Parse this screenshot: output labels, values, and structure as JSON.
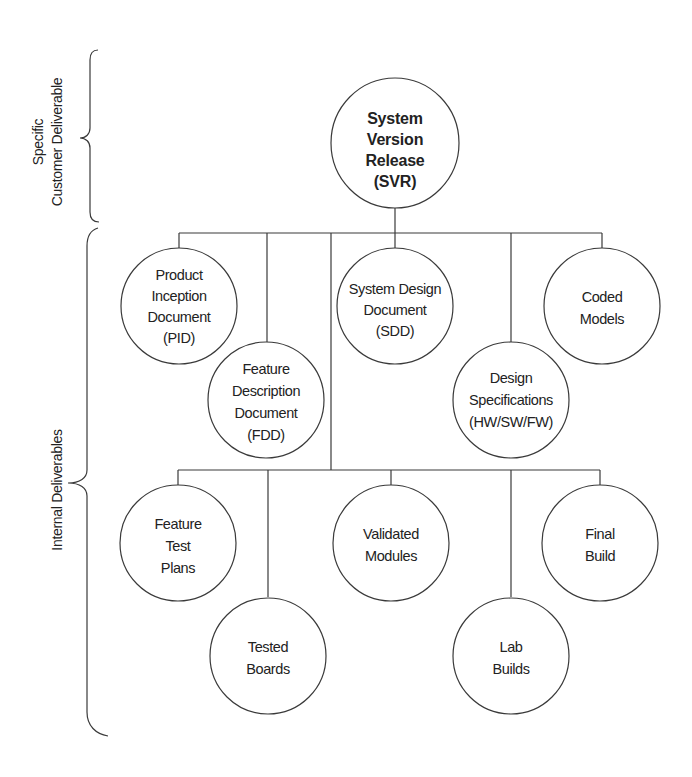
{
  "diagram": {
    "type": "hierarchy",
    "root": {
      "id": "svr",
      "lines": [
        "System",
        "Version",
        "Release",
        "(SVR)"
      ],
      "bold": true
    },
    "level1": [
      {
        "id": "pid",
        "lines": [
          "Product",
          "Inception",
          "Document",
          "(PID)"
        ]
      },
      {
        "id": "fdd",
        "lines": [
          "Feature",
          "Description",
          "Document",
          "(FDD)"
        ]
      },
      {
        "id": "sdd",
        "lines": [
          "System Design",
          "Document",
          "(SDD)"
        ]
      },
      {
        "id": "ds",
        "lines": [
          "Design",
          "Specifications",
          "(HW/SW/FW)"
        ]
      },
      {
        "id": "cm",
        "lines": [
          "Coded",
          "Models"
        ]
      }
    ],
    "level2": [
      {
        "id": "ftp",
        "lines": [
          "Feature",
          "Test",
          "Plans"
        ]
      },
      {
        "id": "tb",
        "lines": [
          "Tested",
          "Boards"
        ]
      },
      {
        "id": "vm",
        "lines": [
          "Validated",
          "Modules"
        ]
      },
      {
        "id": "lb",
        "lines": [
          "Lab",
          "Builds"
        ]
      },
      {
        "id": "fb",
        "lines": [
          "Final",
          "Build"
        ]
      }
    ],
    "side_labels": {
      "customer": {
        "line1": "Specific",
        "line2": "Customer Deliverable"
      },
      "internal": {
        "line1": "Internal Deliverables"
      }
    },
    "colors": {
      "stroke": "#3a3a3a",
      "text": "#222222",
      "background": "#ffffff"
    }
  }
}
